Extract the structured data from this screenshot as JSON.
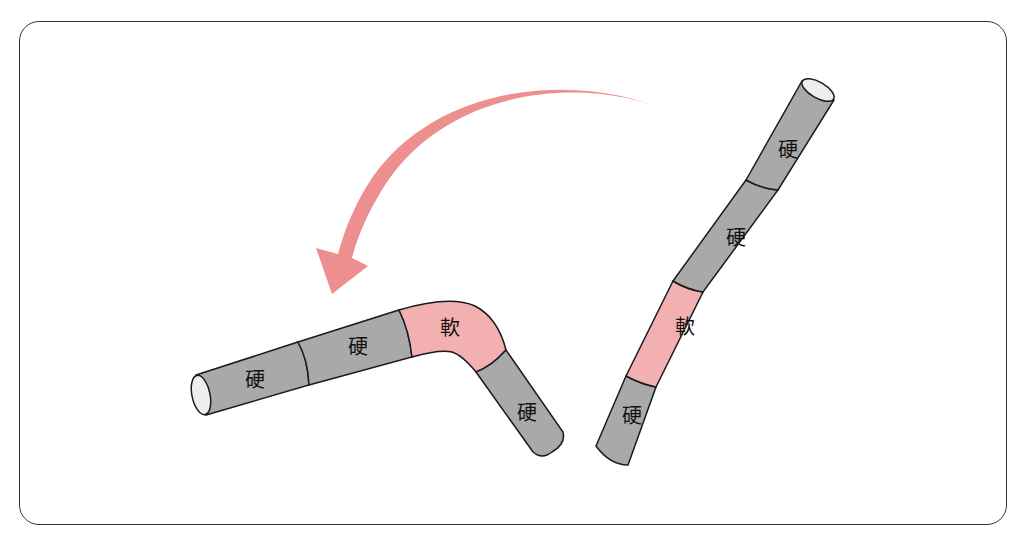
{
  "colors": {
    "hard": "#a9a9a9",
    "soft": "#f2b0b0",
    "arrow": "#ee8f8f",
    "outline": "#1a1a1a",
    "cap": "#eeeeee",
    "frame": "#333333"
  },
  "straight_rod": {
    "segments": [
      {
        "label": "硬",
        "type": "hard"
      },
      {
        "label": "硬",
        "type": "hard"
      },
      {
        "label": "軟",
        "type": "soft"
      },
      {
        "label": "硬",
        "type": "hard"
      }
    ]
  },
  "bent_rod": {
    "segments": [
      {
        "label": "硬",
        "type": "hard"
      },
      {
        "label": "硬",
        "type": "hard"
      },
      {
        "label": "軟",
        "type": "soft"
      },
      {
        "label": "硬",
        "type": "hard"
      }
    ]
  },
  "arrow": {
    "direction": "straight-to-bent"
  }
}
